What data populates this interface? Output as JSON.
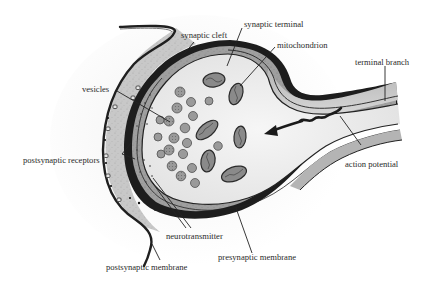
{
  "diagram": {
    "labels": {
      "synaptic_cleft": "synaptic cleft",
      "synaptic_terminal": "synaptic terminal",
      "mitochondrion": "mitochondrion",
      "terminal_branch": "terminal branch",
      "vesicles": "vesicles",
      "postsynaptic_receptors": "postsynaptic receptors",
      "action_potential": "action potential",
      "neurotransmitter": "neurotransmitter",
      "presynaptic_membrane": "presynaptic membrane",
      "postsynaptic_membrane": "postsynaptic membrane"
    },
    "colors": {
      "background": "#ffffff",
      "cleft_fill": "#c9c9c9",
      "terminal_fill": "#ececec",
      "dark_membrane": "#1a1a1a",
      "vesicle_fill": "#9a9a9a",
      "mitochondrion_fill": "#8a8a8a",
      "label_text": "#2a2a2a"
    }
  }
}
